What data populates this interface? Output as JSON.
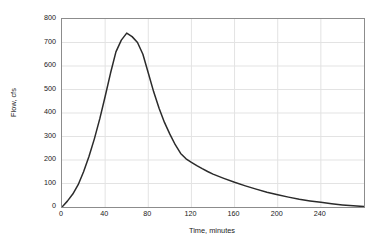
{
  "chart_data": {
    "type": "line",
    "title": "",
    "xlabel": "Time, minutes",
    "ylabel": "Flow, cfs",
    "xlim": [
      0,
      280
    ],
    "ylim": [
      0,
      800
    ],
    "xticks": [
      0,
      40,
      80,
      120,
      160,
      200,
      240
    ],
    "yticks": [
      0,
      100,
      200,
      300,
      400,
      500,
      600,
      700,
      800
    ],
    "grid": true,
    "legend": null,
    "series": [
      {
        "name": "Runoff hydrograph",
        "color": "#2b2b2b",
        "x": [
          0,
          5,
          10,
          15,
          20,
          25,
          30,
          35,
          40,
          45,
          50,
          55,
          60,
          65,
          70,
          75,
          80,
          85,
          90,
          95,
          100,
          105,
          110,
          115,
          120,
          125,
          130,
          135,
          140,
          150,
          160,
          170,
          180,
          190,
          200,
          210,
          220,
          230,
          240,
          250,
          260,
          270,
          280
        ],
        "y": [
          0,
          25,
          55,
          95,
          150,
          215,
          290,
          375,
          470,
          570,
          660,
          710,
          740,
          725,
          700,
          650,
          570,
          490,
          420,
          360,
          310,
          265,
          228,
          205,
          190,
          176,
          163,
          151,
          140,
          122,
          105,
          90,
          76,
          63,
          52,
          42,
          33,
          26,
          20,
          14,
          9,
          5,
          2
        ]
      }
    ]
  },
  "axes": {
    "y_tick_labels": [
      "800",
      "700",
      "600",
      "500",
      "400",
      "300",
      "200",
      "100",
      "0"
    ],
    "x_tick_labels": [
      "0",
      "40",
      "80",
      "120",
      "160",
      "200",
      "240"
    ],
    "x_title": "Time, minutes",
    "y_title": "Flow, cfs"
  },
  "style": {
    "background": "#ffffff",
    "frame_color": "#8c8c8c",
    "grid_color": "#e3e3e3",
    "curve_color": "#2b2b2b",
    "text_color": "#1a1a1a"
  }
}
